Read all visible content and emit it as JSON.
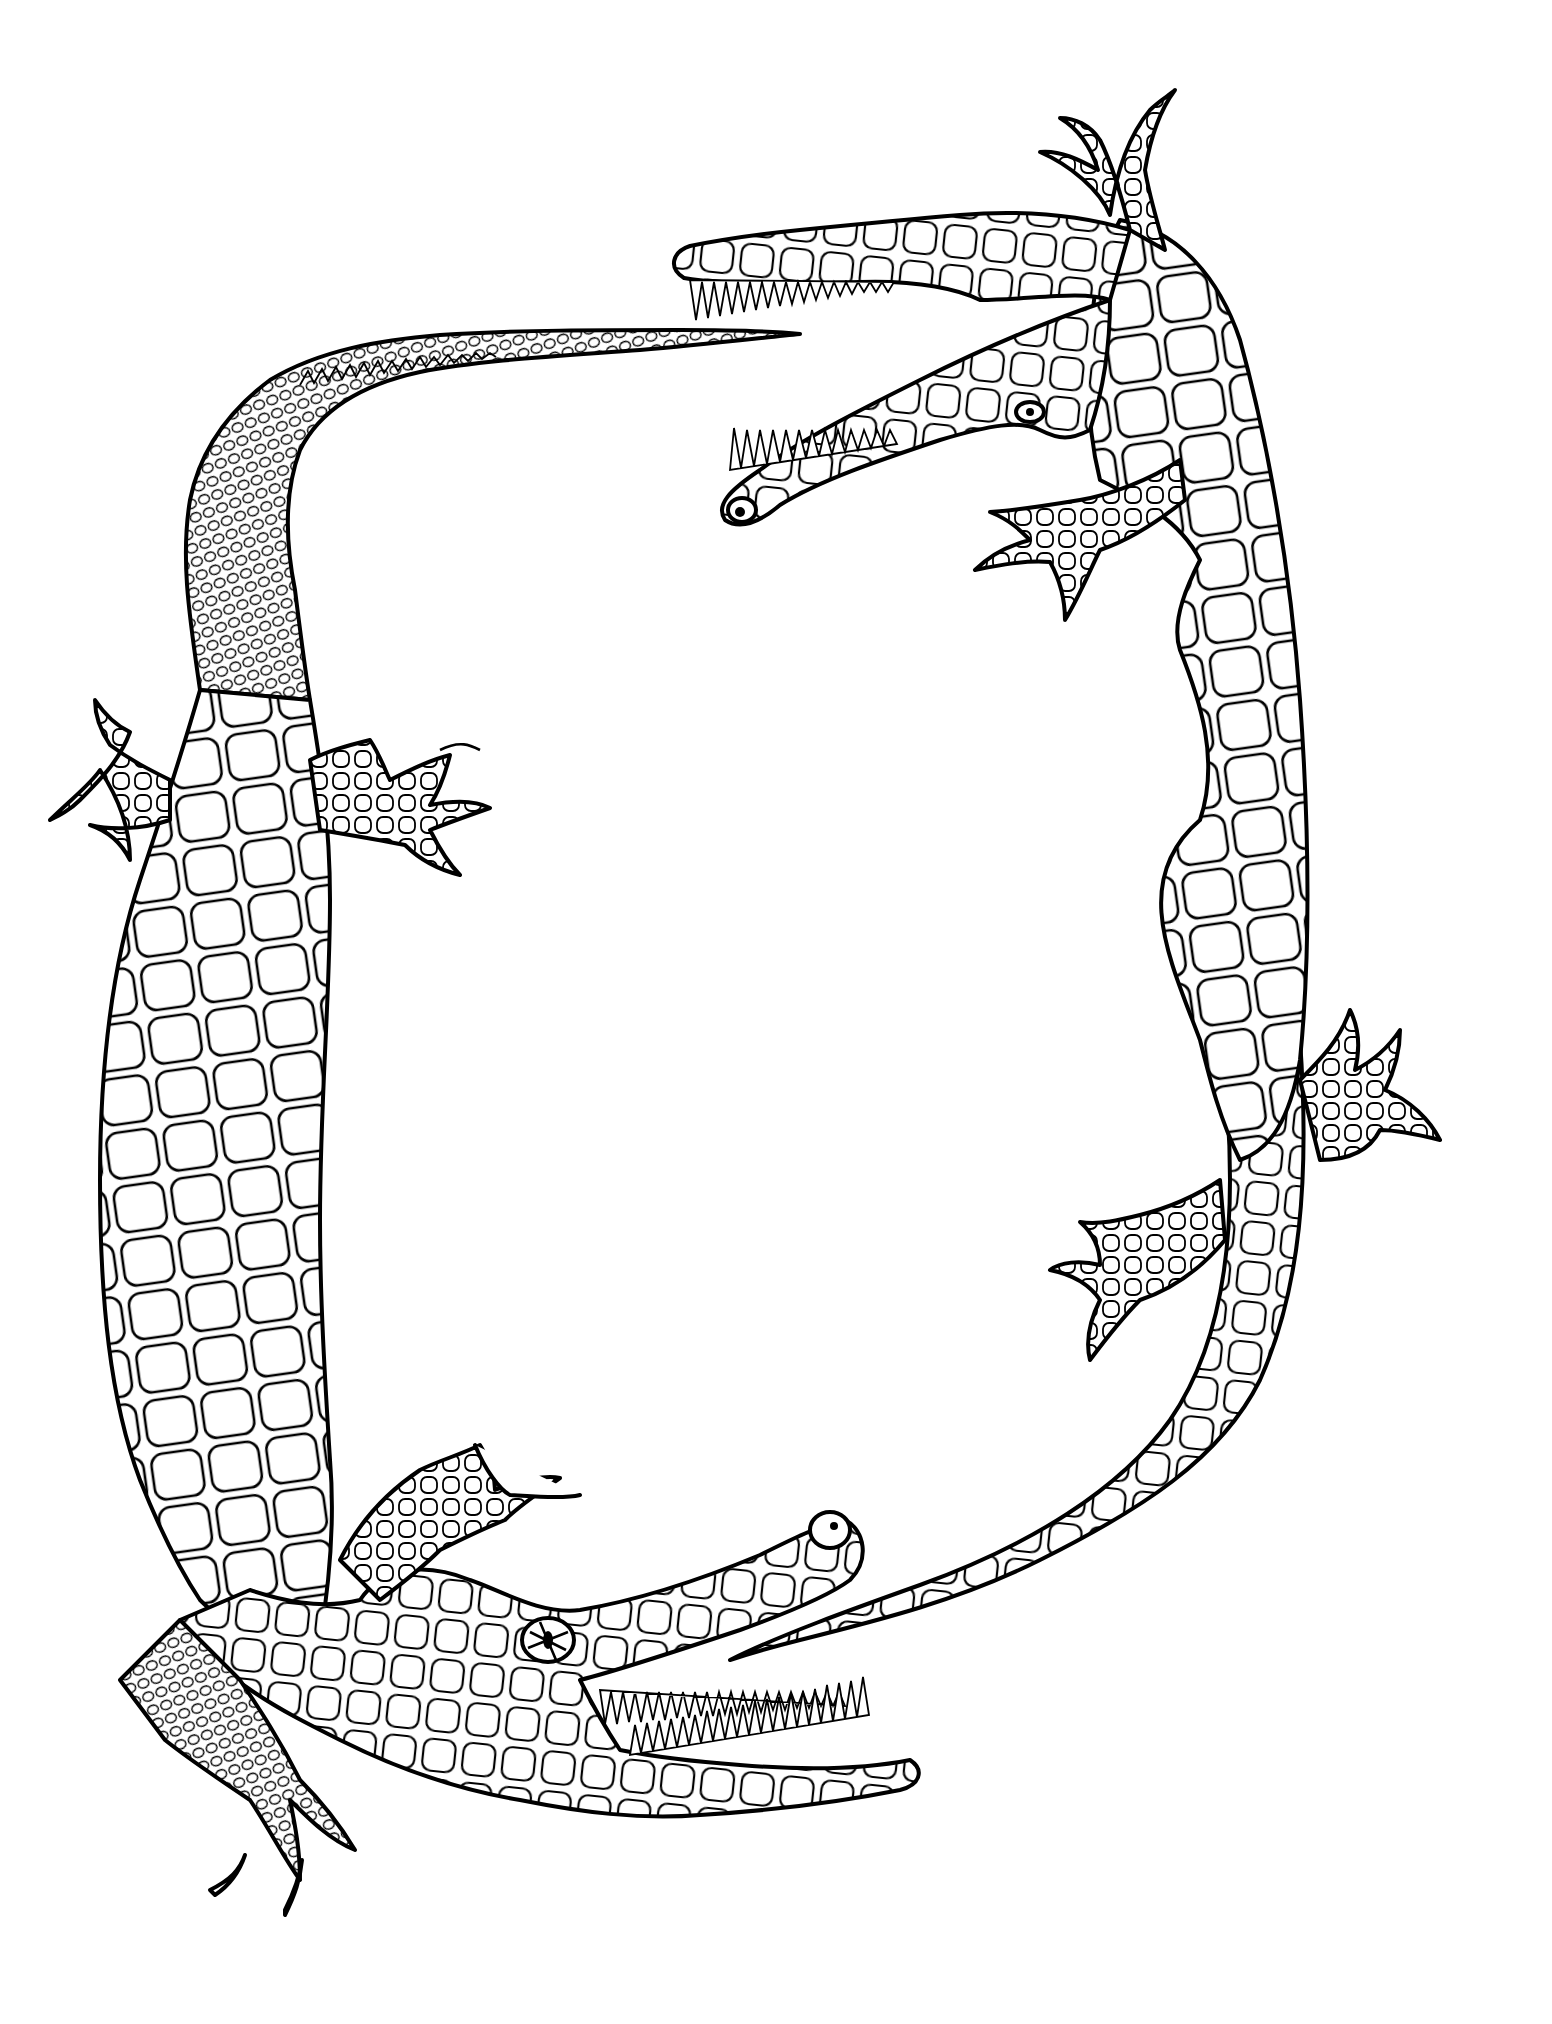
{
  "artwork": {
    "kind": "coloring-page",
    "subject": "two crocodiles forming a frame",
    "description": "Black line-art coloring page of two crocodiles with scaly bodies arranged head-to-tail around an empty white center",
    "background_color": "#ffffff",
    "line_color": "#000000",
    "figures": [
      {
        "id": "crocodile-top-right",
        "head_position": "top, facing left",
        "mouth": "open with teeth",
        "tail_position": "bottom center, curving left"
      },
      {
        "id": "crocodile-bottom-left",
        "head_position": "bottom, facing right",
        "mouth": "open with teeth",
        "tail_position": "top center, extending right"
      }
    ]
  }
}
